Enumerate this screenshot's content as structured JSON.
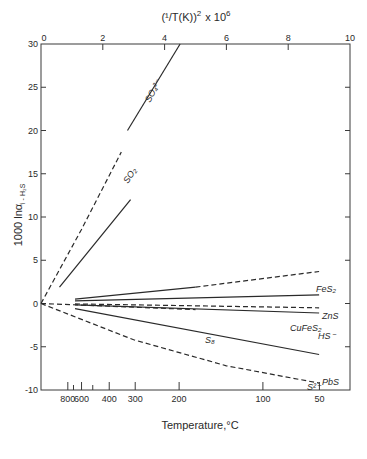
{
  "chart_data": {
    "type": "line",
    "title": "",
    "top_axis": {
      "label": "(1/T(K))² × 10⁶",
      "label_main": "(¹/T(K))",
      "label_exp": "2",
      "label_tail": "x 10",
      "label_tail_exp": "6",
      "range": [
        0,
        10
      ],
      "ticks": [
        "0",
        "2",
        "4",
        "6",
        "8",
        "10"
      ]
    },
    "xlabel": "Temperature,°C",
    "bottom_ticks": [
      {
        "label": "800",
        "x": 0.868
      },
      {
        "label": "700",
        "x": 1.052,
        "minor": true
      },
      {
        "label": "600",
        "x": 1.312
      },
      {
        "label": "500",
        "x": 1.675,
        "minor": true
      },
      {
        "label": "400",
        "x": 2.208
      },
      {
        "label": "300",
        "x": 3.049
      },
      {
        "label": "200",
        "x": 4.47
      },
      {
        "label": "100",
        "x": 7.181
      },
      {
        "label": "50",
        "x": 9.01
      }
    ],
    "bottom_tick_labels": [
      "800",
      "600",
      "400",
      "300",
      "200",
      "100",
      "50"
    ],
    "ylabel": "1000 ln α i-H₂S",
    "ylabel_main": "1000 lnα",
    "ylabel_sub": "i - H₂S",
    "ylim": [
      -10,
      30
    ],
    "yticks": [
      "30",
      "25",
      "20",
      "15",
      "10",
      "5",
      "0",
      "-5",
      "-10"
    ],
    "grid": false,
    "series": [
      {
        "name": "SO4²⁻",
        "label": "SO₄²⁻",
        "segments": [
          {
            "style": "dashed",
            "points": [
              [
                0,
                0
              ],
              [
                1.3,
                8.5
              ],
              [
                2.6,
                17.5
              ]
            ]
          },
          {
            "style": "solid",
            "points": [
              [
                2.8,
                20.0
              ],
              [
                4.5,
                30.0
              ]
            ]
          }
        ]
      },
      {
        "name": "SO2",
        "label": "SO₂",
        "segments": [
          {
            "style": "solid",
            "points": [
              [
                0.6,
                1.9
              ],
              [
                2.9,
                12.0
              ]
            ]
          }
        ]
      },
      {
        "name": "FeS2",
        "label": "FeS₂",
        "segments": [
          {
            "style": "solid",
            "points": [
              [
                1.1,
                0.5
              ],
              [
                5.0,
                1.9
              ]
            ]
          },
          {
            "style": "dashed",
            "points": [
              [
                5.0,
                1.9
              ],
              [
                9.0,
                3.7
              ]
            ]
          }
        ]
      },
      {
        "name": "ZnS",
        "label": "ZnS",
        "segments": [
          {
            "style": "solid",
            "points": [
              [
                1.1,
                0.3
              ],
              [
                9.0,
                1.0
              ]
            ]
          }
        ]
      },
      {
        "name": "CuFeS2",
        "label": "CuFeS₂",
        "segments": [
          {
            "style": "dashed",
            "points": [
              [
                1.1,
                -0.05
              ],
              [
                9.0,
                -0.5
              ]
            ]
          }
        ]
      },
      {
        "name": "HS-",
        "label": "HS⁻",
        "segments": [
          {
            "style": "solid",
            "points": [
              [
                1.1,
                -0.15
              ],
              [
                9.0,
                -1.1
              ]
            ]
          }
        ]
      },
      {
        "name": "S8",
        "label": "S₈",
        "segments": [
          {
            "style": "dashed",
            "points": [
              [
                0,
                0
              ],
              [
                5.0,
                -0.7
              ]
            ]
          }
        ]
      },
      {
        "name": "PbS",
        "label": "PbS",
        "segments": [
          {
            "style": "solid",
            "points": [
              [
                1.1,
                -0.6
              ],
              [
                9.0,
                -5.9
              ]
            ]
          }
        ]
      },
      {
        "name": "S2-",
        "label": "S²⁻",
        "segments": [
          {
            "style": "dashed",
            "points": [
              [
                0,
                0
              ],
              [
                3.0,
                -4.2
              ],
              [
                6.0,
                -7.2
              ],
              [
                9.0,
                -9.2
              ]
            ]
          }
        ]
      }
    ],
    "legend": "inline labels at line ends"
  }
}
